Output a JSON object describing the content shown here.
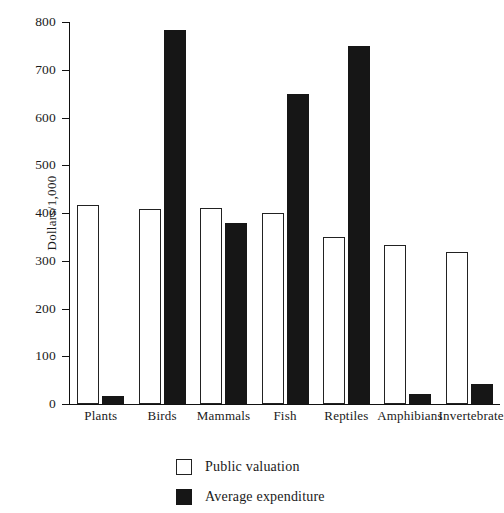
{
  "chart_data": {
    "type": "bar",
    "title": "",
    "subtitle": "",
    "xlabel": "",
    "ylabel": "Dollars/1,000",
    "ylim": [
      0,
      800
    ],
    "yticks": [
      0,
      100,
      200,
      300,
      400,
      500,
      600,
      700,
      800
    ],
    "ytick_labels": [
      "0",
      "100",
      "200",
      "300",
      "400",
      "500",
      "600",
      "700",
      "800"
    ],
    "grid": false,
    "legend_position": "bottom-center",
    "categories": [
      "Plants",
      "Birds",
      "Mammals",
      "Fish",
      "Reptiles",
      "Amphibians",
      "Invertebrates"
    ],
    "series": [
      {
        "name": "Public valuation",
        "color": "#ffffff",
        "edge_color": "#222222",
        "values": [
          417,
          408,
          410,
          401,
          350,
          332,
          318
        ]
      },
      {
        "name": "Average expenditure",
        "color": "#161616",
        "edge_color": "#161616",
        "values": [
          17,
          783,
          380,
          650,
          750,
          22,
          41
        ]
      }
    ]
  },
  "axis": {
    "y_title": "Dollars/1,000"
  },
  "legend": {
    "items": [
      {
        "label": "Public valuation",
        "style": "public"
      },
      {
        "label": "Average expenditure",
        "style": "expenditure"
      }
    ]
  }
}
